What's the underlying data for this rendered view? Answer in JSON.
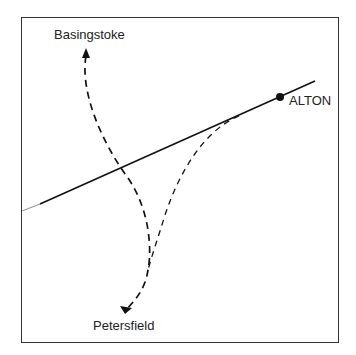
{
  "diagram": {
    "type": "route-map-sketch",
    "places": [
      {
        "name": "Basingstoke",
        "role": "destination-north"
      },
      {
        "name": "ALTON",
        "role": "town-on-line"
      },
      {
        "name": "Petersfield",
        "role": "destination-south"
      }
    ],
    "labels": {
      "basingstoke": "Basingstoke",
      "alton": "ALTON",
      "petersfield": "Petersfield"
    },
    "colors": {
      "line": "#111111",
      "frame": "#333333",
      "background": "#ffffff"
    }
  }
}
